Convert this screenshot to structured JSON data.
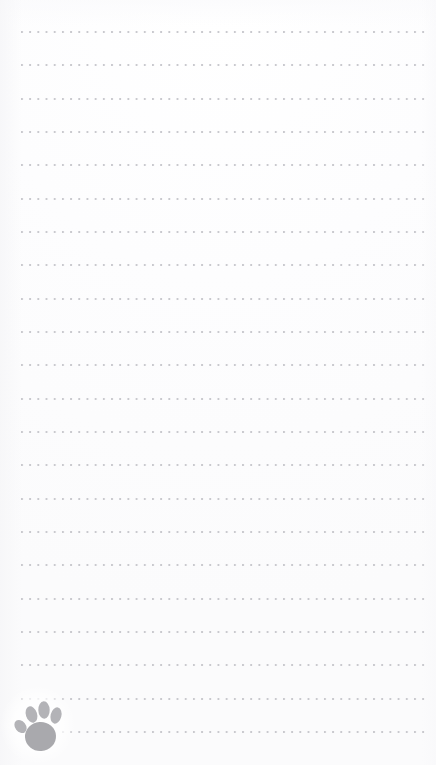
{
  "page": {
    "width": 436,
    "height": 765,
    "background_color": "#fcfcfd"
  },
  "ruling": {
    "style": "dotted",
    "dot_color": "#c9c9ce",
    "dot_size_px": 2,
    "dot_spacing_px": 8.2,
    "row_spacing_px": 33.4,
    "first_row_y_px": 31,
    "left_margin_px": 21,
    "right_edge_px": 427,
    "row_count": 22,
    "row_y_positions": [
      31,
      64,
      98,
      131,
      164,
      198,
      231,
      264,
      298,
      331,
      364,
      398,
      431,
      464,
      498,
      531,
      564,
      598,
      631,
      664,
      698,
      731
    ],
    "row_left_offsets": [
      21,
      21,
      21,
      21,
      21,
      21,
      21,
      21,
      21,
      21,
      21,
      21,
      21,
      21,
      21,
      21,
      21,
      21,
      21,
      21,
      21,
      21
    ]
  },
  "logo": {
    "name": "paw-print",
    "label": "Paw print",
    "color": "#a9a9ad",
    "toe_color": "#b3b3b7",
    "x_px": 12,
    "y_px": 697,
    "width_px": 52,
    "height_px": 56,
    "toe_count": 4
  }
}
